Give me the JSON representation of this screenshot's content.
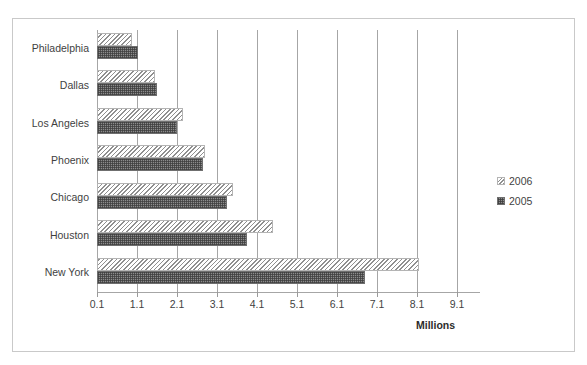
{
  "title_remnant": "",
  "legend": {
    "position": "right",
    "entries": [
      {
        "label": "2006",
        "swatch": "hatch-diagonal-light-swatch"
      },
      {
        "label": "2005",
        "swatch": "checker-dark-swatch"
      }
    ]
  },
  "axis": {
    "x_title": "Millions",
    "tick_labels": [
      "0.1",
      "1.1",
      "2.1",
      "3.1",
      "4.1",
      "5.1",
      "6.1",
      "7.1",
      "8.1",
      "9.1"
    ]
  },
  "colors": {
    "frame_border": "#c9c9c9",
    "gridline": "#a6a6a6",
    "axis_line": "#a6a6a6",
    "text": "#3f3f3f",
    "series_2006_fill": "#f2f2f2",
    "series_2006_hatch": "#8f8f8f",
    "series_2005_fill": "#8c8c8c",
    "series_2005_hatch": "#3c3c3c"
  },
  "chart_data": {
    "type": "bar",
    "orientation": "horizontal",
    "title": "",
    "subtitle": "",
    "xlabel": "Millions",
    "ylabel": "",
    "xlim": [
      0.1,
      9.6
    ],
    "xticks": [
      0.1,
      1.1,
      2.1,
      3.1,
      4.1,
      5.1,
      6.1,
      7.1,
      8.1,
      9.1
    ],
    "grid": "vertical",
    "legend_position": "right",
    "categories": [
      "Philadelphia",
      "Dallas",
      "Los Angeles",
      "Phoenix",
      "Chicago",
      "Houston",
      "New York"
    ],
    "series": [
      {
        "name": "2006",
        "values": [
          0.97,
          1.55,
          2.25,
          2.8,
          3.5,
          4.5,
          8.15
        ]
      },
      {
        "name": "2005",
        "values": [
          1.12,
          1.6,
          2.1,
          2.75,
          3.35,
          3.85,
          6.8
        ]
      }
    ]
  }
}
